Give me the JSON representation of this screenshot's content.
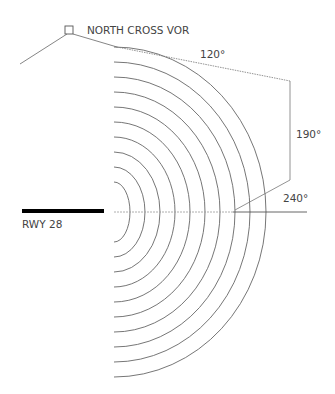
{
  "labels": {
    "vor": "NORTH CROSS VOR",
    "runway": "RWY 28",
    "bearing_120": "120°",
    "bearing_190": "190°",
    "bearing_240": "240°"
  },
  "colors": {
    "line": "#555555",
    "runway": "#000000",
    "text": "#444444"
  },
  "diagram": {
    "arc_count": 10,
    "center": [
      114,
      212
    ]
  }
}
